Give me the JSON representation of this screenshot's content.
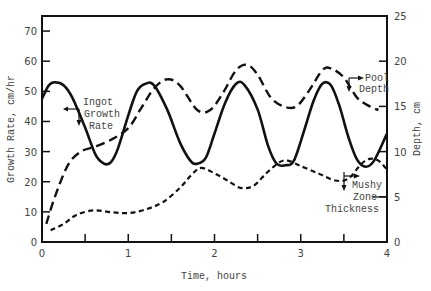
{
  "chart_data": {
    "type": "line",
    "title": "",
    "xlabel": "Time, hours",
    "ylabel": "Growth Rate, cm/hr",
    "y2label": "Depth, cm",
    "xlim": [
      0,
      4
    ],
    "ylim": [
      0,
      75
    ],
    "y2lim": [
      0,
      25
    ],
    "x_ticks": [
      0,
      1,
      2,
      3,
      4
    ],
    "x_minor_ticks": [
      0.5,
      1.5,
      2.5,
      3.5
    ],
    "y_ticks": [
      0,
      10,
      20,
      30,
      40,
      50,
      60,
      70
    ],
    "y2_ticks": [
      0,
      5,
      10,
      15,
      20,
      25
    ],
    "grid": false,
    "legend": "inline annotations",
    "series": [
      {
        "name": "Ingot Growth Rate",
        "axis": "left",
        "style": "solid",
        "x": [
          0.0,
          0.08,
          0.15,
          0.25,
          0.35,
          0.5,
          0.62,
          0.72,
          0.8,
          0.88,
          1.0,
          1.1,
          1.2,
          1.3,
          1.45,
          1.6,
          1.72,
          1.8,
          1.9,
          2.0,
          2.12,
          2.25,
          2.35,
          2.5,
          2.62,
          2.72,
          2.82,
          2.92,
          3.05,
          3.15,
          3.25,
          3.35,
          3.45,
          3.55,
          3.65,
          3.75,
          3.85,
          4.0
        ],
        "values": [
          47.5,
          52,
          53,
          52,
          48,
          38,
          29,
          26,
          26.5,
          31,
          42,
          50,
          52.5,
          52,
          44,
          33,
          27,
          26,
          28,
          36,
          46,
          52.5,
          52,
          44,
          32,
          26,
          25.5,
          27,
          38,
          47,
          52.5,
          52,
          45,
          35,
          27.5,
          25,
          27,
          36
        ]
      },
      {
        "name": "Pool Depth",
        "axis": "right",
        "style": "long-dash",
        "x": [
          0.05,
          0.15,
          0.3,
          0.45,
          0.6,
          0.8,
          1.0,
          1.15,
          1.3,
          1.45,
          1.6,
          1.8,
          1.95,
          2.1,
          2.25,
          2.38,
          2.5,
          2.65,
          2.8,
          2.95,
          3.1,
          3.25,
          3.35,
          3.5,
          3.65,
          3.8,
          3.9
        ],
        "values": [
          2,
          5,
          8.5,
          10,
          10.5,
          11.3,
          12.6,
          14.8,
          17,
          18,
          17.3,
          14.6,
          14.6,
          16.5,
          19,
          19.6,
          18.5,
          16,
          15,
          15,
          16.8,
          19,
          19.2,
          18.2,
          16,
          15,
          14.6
        ]
      },
      {
        "name": "Mushy Zone Thickness",
        "axis": "right",
        "style": "short-dash",
        "x": [
          0.1,
          0.25,
          0.4,
          0.6,
          0.8,
          1.0,
          1.2,
          1.4,
          1.6,
          1.75,
          1.85,
          2.0,
          2.15,
          2.3,
          2.45,
          2.6,
          2.75,
          2.85,
          3.0,
          3.2,
          3.4,
          3.55,
          3.7,
          3.8,
          3.9,
          4.0
        ],
        "values": [
          1.3,
          2,
          3,
          3.5,
          3.3,
          3.2,
          3.6,
          4.4,
          6,
          7.6,
          8.2,
          7.6,
          6.8,
          6,
          6.2,
          7.6,
          8.8,
          9,
          8.4,
          7.6,
          6.8,
          7,
          8.6,
          9.2,
          9,
          8
        ]
      }
    ],
    "annotations": [
      {
        "text_lines": [
          "Ingot",
          "Growth",
          "Rate"
        ],
        "target": "Ingot Growth Rate",
        "arrows": [
          "left",
          "down"
        ]
      },
      {
        "text_lines": [
          "Pool",
          "Depth"
        ],
        "target": "Pool Depth",
        "arrows": [
          "right",
          "down"
        ]
      },
      {
        "text_lines": [
          "Mushy",
          "Zone",
          "Thickness"
        ],
        "target": "Mushy Zone Thickness",
        "arrows": [
          "right",
          "down"
        ]
      }
    ]
  },
  "labels": {
    "xlabel": "Time, hours",
    "ylabel": "Growth Rate, cm/hr",
    "y2label": "Depth, cm",
    "ingot": [
      "Ingot",
      "Growth",
      "Rate"
    ],
    "pool": [
      "Pool",
      "Depth"
    ],
    "mushy": [
      "Mushy",
      "Zone",
      "Thickness"
    ]
  }
}
